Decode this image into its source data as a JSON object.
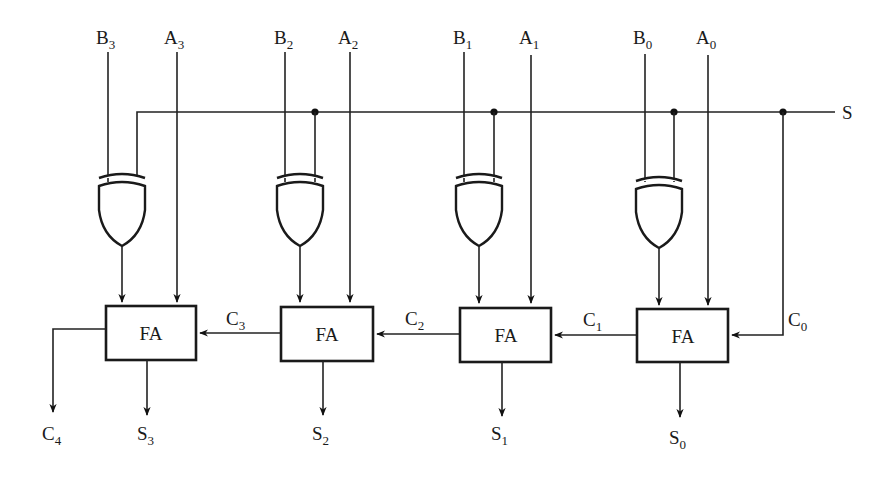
{
  "diagram": {
    "control_label": "S",
    "block_label": "FA",
    "stages": [
      {
        "index": 3,
        "b_label": "B",
        "b_sub": "3",
        "a_label": "A",
        "a_sub": "3",
        "sum_label": "S",
        "sum_sub": "3",
        "carry_in_label": "C",
        "carry_in_sub": "3"
      },
      {
        "index": 2,
        "b_label": "B",
        "b_sub": "2",
        "a_label": "A",
        "a_sub": "2",
        "sum_label": "S",
        "sum_sub": "2",
        "carry_in_label": "C",
        "carry_in_sub": "2"
      },
      {
        "index": 1,
        "b_label": "B",
        "b_sub": "1",
        "a_label": "A",
        "a_sub": "1",
        "sum_label": "S",
        "sum_sub": "1",
        "carry_in_label": "C",
        "carry_in_sub": "1"
      },
      {
        "index": 0,
        "b_label": "B",
        "b_sub": "0",
        "a_label": "A",
        "a_sub": "0",
        "sum_label": "S",
        "sum_sub": "0",
        "carry_in_label": "C",
        "carry_in_sub": "0"
      }
    ],
    "carry_out": {
      "label": "C",
      "sub": "4"
    },
    "gate_type": "XOR",
    "colors": {
      "line": "#1a1a1a",
      "background": "#ffffff"
    }
  }
}
